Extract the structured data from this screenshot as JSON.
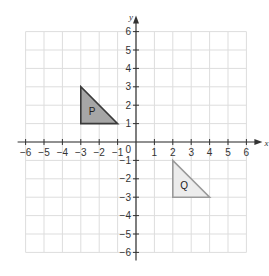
{
  "diagram": {
    "type": "coordinate-grid",
    "x_axis": {
      "label": "x",
      "min": -6,
      "max": 6,
      "ticks": [
        "-6",
        "-5",
        "-4",
        "-3",
        "-2",
        "-1",
        "1",
        "2",
        "3",
        "4",
        "5",
        "6"
      ]
    },
    "y_axis": {
      "label": "y",
      "min": -6,
      "max": 6,
      "ticks": [
        "6",
        "5",
        "4",
        "3",
        "2",
        "1",
        "-1",
        "-2",
        "-3",
        "-4",
        "-5",
        "-6"
      ]
    },
    "origin_label": "0",
    "shapes": [
      {
        "name": "P",
        "vertices": [
          [
            -3,
            1
          ],
          [
            -3,
            3
          ],
          [
            -1,
            1
          ]
        ],
        "fill": "#a6a6a6",
        "stroke": "#3a3a3a"
      },
      {
        "name": "Q",
        "vertices": [
          [
            2,
            -3
          ],
          [
            2,
            -1
          ],
          [
            4,
            -3
          ]
        ],
        "fill": "#ececec",
        "stroke": "#9a9a9a"
      }
    ],
    "colors": {
      "grid": "#dddddd",
      "axis": "#333333"
    }
  }
}
